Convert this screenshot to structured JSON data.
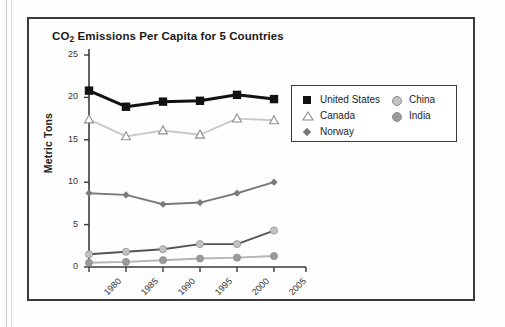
{
  "figure": {
    "title_main": "CO",
    "title_sub": "2",
    "title_rest": " Emissions Per Capita for 5 Countries"
  },
  "axes": {
    "ylabel": "Metric Tons",
    "ytick_labels": [
      "25",
      "20",
      "15",
      "10",
      "5",
      "0"
    ],
    "xtick_labels": [
      "1980",
      "1985",
      "1990",
      "1995",
      "2000",
      "2005"
    ]
  },
  "legend": {
    "left_entries": [
      {
        "label": "United States",
        "marker": "filled-square",
        "color": "#121212"
      },
      {
        "label": "Canada",
        "marker": "open-triangle",
        "color": "#8e8e8e"
      },
      {
        "label": "Norway",
        "marker": "diamond",
        "color": "#7a7a7a"
      }
    ],
    "right_entries": [
      {
        "label": "China",
        "marker": "circle",
        "color": "#c2c2c2"
      },
      {
        "label": "India",
        "marker": "circle",
        "color": "#9a9a9a"
      }
    ]
  },
  "chart_data": {
    "type": "line",
    "title": "CO2 Emissions Per Capita for 5 Countries",
    "xlabel": "",
    "ylabel": "Metric Tons",
    "categories": [
      "1980",
      "1985",
      "1990",
      "1995",
      "2000",
      "2005"
    ],
    "ylim": [
      0,
      25
    ],
    "yticks": [
      0,
      5,
      10,
      15,
      20,
      25
    ],
    "grid": false,
    "legend_position": "upper-right-outside",
    "series": [
      {
        "name": "United States",
        "marker": "filled-square",
        "color": "#121212",
        "line_color": "#121212",
        "values": [
          20.8,
          18.9,
          19.5,
          19.6,
          20.3,
          19.8
        ]
      },
      {
        "name": "Canada",
        "marker": "open-triangle",
        "color": "#ffffff",
        "line_color": "#c9c9c9",
        "values": [
          17.4,
          15.4,
          16.1,
          15.6,
          17.5,
          17.3
        ]
      },
      {
        "name": "Norway",
        "marker": "diamond",
        "color": "#7a7a7a",
        "line_color": "#7a7a7a",
        "values": [
          8.7,
          8.5,
          7.4,
          7.6,
          8.7,
          10.0
        ]
      },
      {
        "name": "China",
        "marker": "circle",
        "color": "#c2c2c2",
        "line_color": "#555555",
        "values": [
          1.5,
          1.8,
          2.1,
          2.7,
          2.7,
          4.3
        ]
      },
      {
        "name": "India",
        "marker": "circle",
        "color": "#9a9a9a",
        "line_color": "#b4b4b4",
        "values": [
          0.5,
          0.6,
          0.8,
          1.0,
          1.1,
          1.3
        ]
      }
    ]
  }
}
